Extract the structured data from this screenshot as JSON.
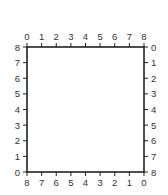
{
  "chart_data": {
    "type": "table",
    "title": "",
    "axes": {
      "top": {
        "ticks": [
          "0",
          "1",
          "2",
          "3",
          "4",
          "5",
          "6",
          "7",
          "8"
        ]
      },
      "bottom": {
        "ticks": [
          "8",
          "7",
          "6",
          "5",
          "4",
          "3",
          "2",
          "1",
          "0"
        ]
      },
      "left": {
        "ticks": [
          "8",
          "7",
          "6",
          "5",
          "4",
          "3",
          "2",
          "1",
          "0"
        ]
      },
      "right": {
        "ticks": [
          "0",
          "1",
          "2",
          "3",
          "4",
          "5",
          "6",
          "7",
          "8"
        ]
      }
    },
    "xlim": [
      0,
      8
    ],
    "ylim": [
      0,
      8
    ],
    "grid": false,
    "series": []
  },
  "frame": {
    "left": 27,
    "top": 47,
    "right": 144,
    "bottom": 172,
    "stroke": "#222222"
  }
}
